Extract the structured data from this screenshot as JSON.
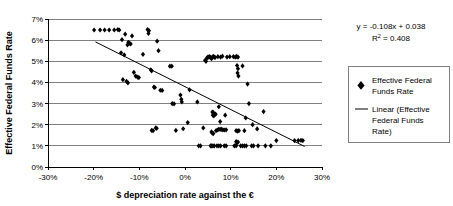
{
  "chart_data": {
    "type": "scatter",
    "title": "",
    "xlabel": "$ depreciation rate against the €",
    "ylabel": "Effective Federal Funds Rate",
    "xlim": [
      -0.3,
      0.3
    ],
    "ylim": [
      0.0,
      0.07
    ],
    "grid": true,
    "grid_axis": "y",
    "legend_position": "right",
    "xticks": [
      "-30%",
      "-20%",
      "-10%",
      "0%",
      "10%",
      "20%",
      "30%"
    ],
    "xtick_values": [
      -0.3,
      -0.2,
      -0.1,
      0.0,
      0.1,
      0.2,
      0.3
    ],
    "yticks": [
      "0%",
      "1%",
      "2%",
      "3%",
      "4%",
      "5%",
      "6%",
      "7%"
    ],
    "ytick_values": [
      0.0,
      0.01,
      0.02,
      0.03,
      0.04,
      0.05,
      0.06,
      0.07
    ],
    "annotations": {
      "equation": "y = -0.108x + 0.038",
      "r_squared_label": "R",
      "r_squared_sup": "2",
      "r_squared_value": "= 0.408"
    },
    "series": [
      {
        "name": "Effective Federal Funds Rate",
        "type": "scatter",
        "marker": "diamond",
        "color": "#000000",
        "points": [
          [
            -0.199,
            0.0648
          ],
          [
            -0.186,
            0.0648
          ],
          [
            -0.176,
            0.0648
          ],
          [
            -0.166,
            0.0648
          ],
          [
            -0.155,
            0.0648
          ],
          [
            -0.147,
            0.065
          ],
          [
            -0.144,
            0.0648
          ],
          [
            -0.138,
            0.0602
          ],
          [
            -0.131,
            0.0628
          ],
          [
            -0.126,
            0.0578
          ],
          [
            -0.124,
            0.059
          ],
          [
            -0.122,
            0.0585
          ],
          [
            -0.119,
            0.0582
          ],
          [
            -0.116,
            0.062
          ],
          [
            -0.14,
            0.054
          ],
          [
            -0.133,
            0.053
          ],
          [
            -0.112,
            0.0448
          ],
          [
            -0.108,
            0.043
          ],
          [
            -0.104,
            0.0425
          ],
          [
            -0.101,
            0.0423
          ],
          [
            -0.136,
            0.0413
          ],
          [
            -0.128,
            0.0405
          ],
          [
            -0.125,
            0.0398
          ],
          [
            -0.092,
            0.0533
          ],
          [
            -0.082,
            0.065
          ],
          [
            -0.079,
            0.0645
          ],
          [
            -0.08,
            0.0632
          ],
          [
            -0.075,
            0.046
          ],
          [
            -0.073,
            0.0455
          ],
          [
            -0.068,
            0.0378
          ],
          [
            -0.066,
            0.0376
          ],
          [
            -0.061,
            0.0595
          ],
          [
            -0.058,
            0.055
          ],
          [
            -0.054,
            0.0363
          ],
          [
            -0.05,
            0.0362
          ],
          [
            -0.073,
            0.0173
          ],
          [
            -0.07,
            0.0172
          ],
          [
            -0.064,
            0.0185
          ],
          [
            -0.062,
            0.0183
          ],
          [
            -0.033,
            0.0477
          ],
          [
            -0.029,
            0.0477
          ],
          [
            -0.028,
            0.03
          ],
          [
            -0.024,
            0.0299
          ],
          [
            -0.02,
            0.0173
          ],
          [
            -0.01,
            0.034
          ],
          [
            -0.008,
            0.032
          ],
          [
            -0.007,
            0.0308
          ],
          [
            -0.004,
            0.0181
          ],
          [
            0.006,
            0.021
          ],
          [
            0.01,
            0.0365
          ],
          [
            0.027,
            0.0308
          ],
          [
            0.03,
            0.01
          ],
          [
            0.034,
            0.01
          ],
          [
            0.04,
            0.0185
          ],
          [
            0.044,
            0.0505
          ],
          [
            0.046,
            0.05
          ],
          [
            0.048,
            0.0515
          ],
          [
            0.05,
            0.052
          ],
          [
            0.052,
            0.052
          ],
          [
            0.054,
            0.0522
          ],
          [
            0.056,
            0.0518
          ],
          [
            0.058,
            0.0512
          ],
          [
            0.06,
            0.052
          ],
          [
            0.062,
            0.0523
          ],
          [
            0.064,
            0.052
          ],
          [
            0.066,
            0.0518
          ],
          [
            0.06,
            0.026
          ],
          [
            0.062,
            0.0258
          ],
          [
            0.061,
            0.0245
          ],
          [
            0.063,
            0.0242
          ],
          [
            0.065,
            0.0248
          ],
          [
            0.067,
            0.025
          ],
          [
            0.058,
            0.0166
          ],
          [
            0.06,
            0.016
          ],
          [
            0.062,
            0.0158
          ],
          [
            0.056,
            0.01
          ],
          [
            0.058,
            0.01
          ],
          [
            0.061,
            0.01
          ],
          [
            0.064,
            0.01
          ],
          [
            0.072,
            0.0522
          ],
          [
            0.078,
            0.052
          ],
          [
            0.082,
            0.0524
          ],
          [
            0.074,
            0.0285
          ],
          [
            0.077,
            0.0215
          ],
          [
            0.068,
            0.0172
          ],
          [
            0.071,
            0.0175
          ],
          [
            0.074,
            0.0178
          ],
          [
            0.077,
            0.0178
          ],
          [
            0.08,
            0.0178
          ],
          [
            0.083,
            0.0176
          ],
          [
            0.07,
            0.01
          ],
          [
            0.074,
            0.01
          ],
          [
            0.078,
            0.01
          ],
          [
            0.092,
            0.052
          ],
          [
            0.098,
            0.0522
          ],
          [
            0.088,
            0.0245
          ],
          [
            0.086,
            0.0175
          ],
          [
            0.09,
            0.0176
          ],
          [
            0.086,
            0.01
          ],
          [
            0.09,
            0.01
          ],
          [
            0.106,
            0.0522
          ],
          [
            0.11,
            0.052
          ],
          [
            0.113,
            0.0523
          ],
          [
            0.116,
            0.052
          ],
          [
            0.114,
            0.048
          ],
          [
            0.116,
            0.0465
          ],
          [
            0.115,
            0.0445
          ],
          [
            0.117,
            0.043
          ],
          [
            0.112,
            0.0172
          ],
          [
            0.115,
            0.017
          ],
          [
            0.118,
            0.0172
          ],
          [
            0.112,
            0.012
          ],
          [
            0.114,
            0.0115
          ],
          [
            0.116,
            0.0118
          ],
          [
            0.108,
            0.01
          ],
          [
            0.112,
            0.01
          ],
          [
            0.126,
            0.0478
          ],
          [
            0.122,
            0.01
          ],
          [
            0.126,
            0.01
          ],
          [
            0.137,
            0.0392
          ],
          [
            0.14,
            0.03
          ],
          [
            0.133,
            0.0232
          ],
          [
            0.13,
            0.0172
          ],
          [
            0.13,
            0.01
          ],
          [
            0.134,
            0.01
          ],
          [
            0.148,
            0.02
          ],
          [
            0.146,
            0.01
          ],
          [
            0.15,
            0.01
          ],
          [
            0.158,
            0.018
          ],
          [
            0.16,
            0.01
          ],
          [
            0.172,
            0.0262
          ],
          [
            0.176,
            0.01
          ],
          [
            0.188,
            0.01
          ],
          [
            0.2,
            0.0125
          ],
          [
            0.24,
            0.0125
          ],
          [
            0.248,
            0.0125
          ],
          [
            0.254,
            0.0126
          ],
          [
            0.258,
            0.0125
          ]
        ]
      },
      {
        "name": "Linear (Effective Federal Funds Rate)",
        "type": "line",
        "color": "#000000",
        "slope": -0.108,
        "intercept": 0.038,
        "x_start": -0.196,
        "x_end": 0.262
      }
    ],
    "legend_entries": [
      {
        "label": "Effective Federal Funds Rate",
        "marker": "diamond"
      },
      {
        "label": "Linear (Effective Federal Funds Rate)",
        "marker": "line"
      }
    ]
  }
}
